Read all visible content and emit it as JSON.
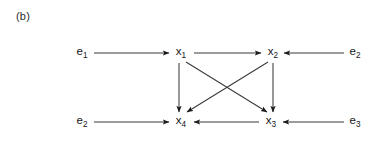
{
  "figure": {
    "panel_label": "(b)",
    "width": 382,
    "height": 141,
    "background_color": "#ffffff",
    "line_color": "#3a3a3a",
    "arrow_color": "#1c1c1c",
    "text_color": "#161616"
  },
  "nodes": [
    {
      "id": "e1_left",
      "base": "e",
      "subscript": "1",
      "label": "e1",
      "x": 82,
      "y": 53,
      "kind": "exogenous"
    },
    {
      "id": "x1",
      "base": "x",
      "subscript": "1",
      "label": "x1",
      "x": 181,
      "y": 53,
      "kind": "endogenous"
    },
    {
      "id": "x2",
      "base": "x",
      "subscript": "2",
      "label": "x2",
      "x": 273,
      "y": 53,
      "kind": "endogenous"
    },
    {
      "id": "e2_right",
      "base": "e",
      "subscript": "2",
      "label": "e2",
      "x": 355,
      "y": 53,
      "kind": "exogenous"
    },
    {
      "id": "e2_left",
      "base": "e",
      "subscript": "2",
      "label": "e2",
      "x": 82,
      "y": 122,
      "kind": "exogenous"
    },
    {
      "id": "x4",
      "base": "x",
      "subscript": "4",
      "label": "x4",
      "x": 181,
      "y": 122,
      "kind": "endogenous"
    },
    {
      "id": "x3",
      "base": "x",
      "subscript": "3",
      "label": "x3",
      "x": 271,
      "y": 122,
      "kind": "endogenous"
    },
    {
      "id": "e3_right",
      "base": "e",
      "subscript": "3",
      "label": "e3",
      "x": 355,
      "y": 122,
      "kind": "exogenous"
    }
  ],
  "edges": [
    {
      "id": "e1-to-x1",
      "from": "e1_left",
      "to": "x1",
      "orientation": "horizontal-right",
      "x1": 94,
      "y1": 53,
      "x2": 169,
      "y2": 53
    },
    {
      "id": "x1-to-x2",
      "from": "x1",
      "to": "x2",
      "orientation": "horizontal-right",
      "x1": 194,
      "y1": 53,
      "x2": 261,
      "y2": 53
    },
    {
      "id": "e2-to-x2",
      "from": "e2_right",
      "to": "x2",
      "orientation": "horizontal-left",
      "x1": 344,
      "y1": 53,
      "x2": 284,
      "y2": 53
    },
    {
      "id": "e2-to-x4",
      "from": "e2_left",
      "to": "x4",
      "orientation": "horizontal-right",
      "x1": 94,
      "y1": 122,
      "x2": 169,
      "y2": 122
    },
    {
      "id": "x3-to-x4",
      "from": "x3",
      "to": "x4",
      "orientation": "horizontal-left",
      "x1": 259,
      "y1": 122,
      "x2": 194,
      "y2": 122
    },
    {
      "id": "e3-to-x3",
      "from": "e3_right",
      "to": "x3",
      "orientation": "horizontal-left",
      "x1": 344,
      "y1": 122,
      "x2": 283,
      "y2": 122
    },
    {
      "id": "x1-to-x4",
      "from": "x1",
      "to": "x4",
      "orientation": "vertical-down",
      "x1": 179,
      "y1": 63,
      "x2": 179,
      "y2": 112
    },
    {
      "id": "x2-to-x3",
      "from": "x2",
      "to": "x3",
      "orientation": "vertical-down",
      "x1": 273,
      "y1": 63,
      "x2": 273,
      "y2": 112
    },
    {
      "id": "x1-to-x3",
      "from": "x1",
      "to": "x3",
      "orientation": "diagonal-down-right",
      "x1": 186,
      "y1": 62,
      "x2": 267,
      "y2": 112
    },
    {
      "id": "x2-to-x4",
      "from": "x2",
      "to": "x4",
      "orientation": "diagonal-down-left",
      "x1": 268,
      "y1": 62,
      "x2": 187,
      "y2": 112
    }
  ]
}
